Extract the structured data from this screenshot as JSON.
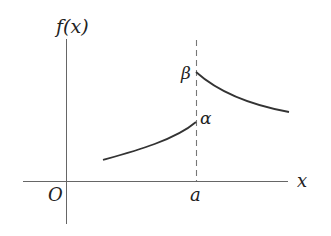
{
  "diagram": {
    "y_axis_label": "f(x)",
    "x_axis_label": "x",
    "origin_label": "O",
    "discontinuity_label": "a",
    "left_limit_label": "α",
    "right_limit_label": "β",
    "colors": {
      "axis": "#555555",
      "curve": "#333333",
      "dashed": "#777777",
      "text": "#222222"
    }
  }
}
